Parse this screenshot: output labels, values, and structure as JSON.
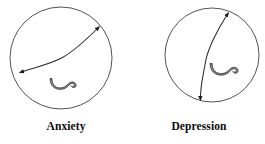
{
  "figure": {
    "background_color": "#ffffff",
    "stroke_color": "#2b2b2b",
    "text_color": "#0b0b0b",
    "panels": [
      {
        "id": "anxiety",
        "caption": "Anxiety",
        "circle": {
          "cx": 61,
          "cy": 58,
          "r": 51
        },
        "arrow": {
          "type": "double-headed-curved-arrow",
          "start": {
            "x": 19,
            "y": 73
          },
          "bend": {
            "x": 62,
            "y": 58
          },
          "end": {
            "x": 100,
            "y": 26
          }
        },
        "ribbon": {
          "cx": 62,
          "cy": 85,
          "width": 26,
          "height": 12
        }
      },
      {
        "id": "depression",
        "caption": "Depression",
        "circle": {
          "cx": 79,
          "cy": 55,
          "r": 47
        },
        "arrow": {
          "type": "double-headed-curved-arrow",
          "start": {
            "x": 67,
            "y": 101
          },
          "bend": {
            "x": 72,
            "y": 62
          },
          "end": {
            "x": 96,
            "y": 12
          }
        },
        "ribbon": {
          "cx": 90,
          "cy": 70,
          "width": 28,
          "height": 13
        }
      }
    ]
  }
}
